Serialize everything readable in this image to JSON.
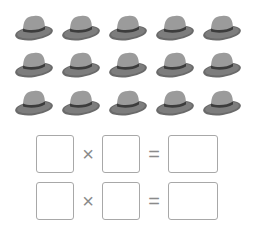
{
  "hats": {
    "rows": 3,
    "cols": 5,
    "colors": {
      "crown": "#9b9b9b",
      "brim": "#7d7d7d",
      "band": "#3c3c3c",
      "brim_edge": "#6a6a6a"
    }
  },
  "equations": [
    {
      "operator": "×",
      "equals": "=",
      "left": "",
      "right": "",
      "result": ""
    },
    {
      "operator": "×",
      "equals": "=",
      "left": "",
      "right": "",
      "result": ""
    }
  ]
}
